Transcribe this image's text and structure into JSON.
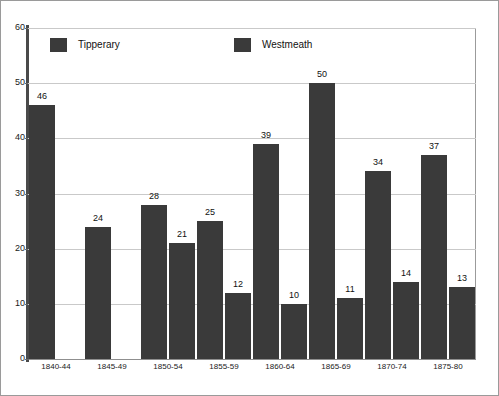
{
  "chart_data": {
    "type": "bar",
    "title": "",
    "subtitle": "",
    "xlabel": "",
    "ylabel": "",
    "ylim": [
      0,
      60
    ],
    "ytick_values": [
      60,
      50,
      40,
      30,
      20,
      10,
      0
    ],
    "ytick_labels": [
      "60",
      "50",
      "40",
      "30",
      "20",
      "10",
      "0"
    ],
    "grid": "horizontal",
    "legend_position": "top-inside",
    "bar_color": "#3a3a3a",
    "categories": [
      "1840-44",
      "1845-49",
      "1850-54",
      "1855-59",
      "1860-64",
      "1865-69",
      "1870-74",
      "1875-80"
    ],
    "series": [
      {
        "name": "Tipperary",
        "values": [
          46,
          24,
          28,
          25,
          39,
          50,
          34,
          37
        ],
        "value_labels": [
          "46",
          "24",
          "28",
          "25",
          "39",
          "50",
          "34",
          "37"
        ],
        "color": "#3a3a3a"
      },
      {
        "name": "Westmeath",
        "values": [
          null,
          null,
          21,
          12,
          10,
          11,
          14,
          13
        ],
        "value_labels": [
          "",
          "",
          "21",
          "12",
          "10",
          "11",
          "14",
          "13"
        ],
        "color": "#3a3a3a"
      }
    ]
  },
  "legend": {
    "entries": [
      {
        "label": "Tipperary",
        "swatch_color": "#3a3a3a"
      },
      {
        "label": "Westmeath",
        "swatch_color": "#3a3a3a"
      }
    ]
  },
  "axes": {
    "y_ticks": [
      "60",
      "50",
      "40",
      "30",
      "20",
      "10",
      "0"
    ],
    "x_ticks": [
      "1840-44",
      "1845-49",
      "1850-54",
      "1855-59",
      "1860-64",
      "1865-69",
      "1870-74",
      "1875-80"
    ]
  }
}
